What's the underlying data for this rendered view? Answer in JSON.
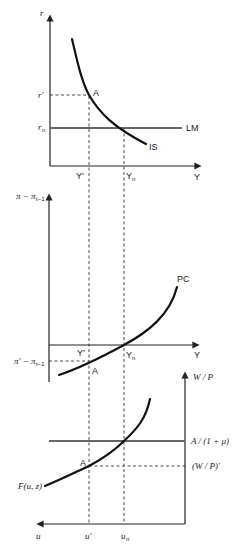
{
  "diagram": {
    "panels": [
      {
        "id": "is-lm",
        "y_axis_label": "r",
        "x_axis_label": "Y",
        "y_ticks": [
          "r'",
          "rₙ"
        ],
        "x_ticks": [
          "Y'",
          "Yₙ"
        ],
        "curves": [
          {
            "name": "IS",
            "label": "IS",
            "shape": "downward-sloping convex"
          },
          {
            "name": "LM",
            "label": "LM",
            "shape": "horizontal at rₙ"
          }
        ],
        "points": [
          {
            "label": "A",
            "at": "(Y', r')"
          }
        ]
      },
      {
        "id": "phillips-curve",
        "y_axis_label": "π − πₜ₋₁",
        "x_axis_label": "Y",
        "y_ticks": [
          "π' − πₜ₋₁"
        ],
        "x_ticks": [
          "Y'",
          "Yₙ"
        ],
        "curves": [
          {
            "name": "PC",
            "label": "PC",
            "shape": "upward-sloping convex, crosses zero at Yₙ"
          }
        ],
        "points": [
          {
            "label": "A",
            "at": "(Y', π' − πₜ₋₁)"
          }
        ]
      },
      {
        "id": "labor-market",
        "y_axis_label": "W / P",
        "x_axis_label": "u",
        "y_ticks": [
          "A / (1 + μ)",
          "(W / P)'"
        ],
        "x_ticks": [
          "u'",
          "uₙ"
        ],
        "curves": [
          {
            "name": "wage-setting",
            "label": "F(u, z)",
            "shape": "upward-sloping convex"
          },
          {
            "name": "price-setting",
            "label": "A / (1 + μ)",
            "shape": "horizontal"
          }
        ],
        "points": [
          {
            "label": "A",
            "at": "(u', (W/P)')"
          }
        ]
      }
    ],
    "labels": {
      "p1_yaxis": "r",
      "p1_xaxis": "Y",
      "p1_rprime": "r'",
      "p1_rn": "r",
      "p1_rn_sub": "n",
      "p1_A": "A",
      "p1_LM": "LM",
      "p1_IS": "IS",
      "p1_Yprime": "Y'",
      "p1_Yn": "Y",
      "p1_Yn_sub": "n",
      "p2_yaxis": "π − π",
      "p2_yaxis_sub": "t−1",
      "p2_xaxis": "Y",
      "p2_PC": "PC",
      "p2_Yprime": "Y'",
      "p2_Yn": "Y",
      "p2_Yn_sub": "n",
      "p2_ytick": "π' − π",
      "p2_ytick_sub": "t−1",
      "p2_A": "A",
      "p3_yaxis": "W / P",
      "p3_xaxis": "u",
      "p3_price": "A / (1 + μ)",
      "p3_wprime": "(W / P)'",
      "p3_F": "F(u, z)",
      "p3_A": "A",
      "p3_uprime": "u'",
      "p3_un": "u",
      "p3_un_sub": "n"
    }
  }
}
